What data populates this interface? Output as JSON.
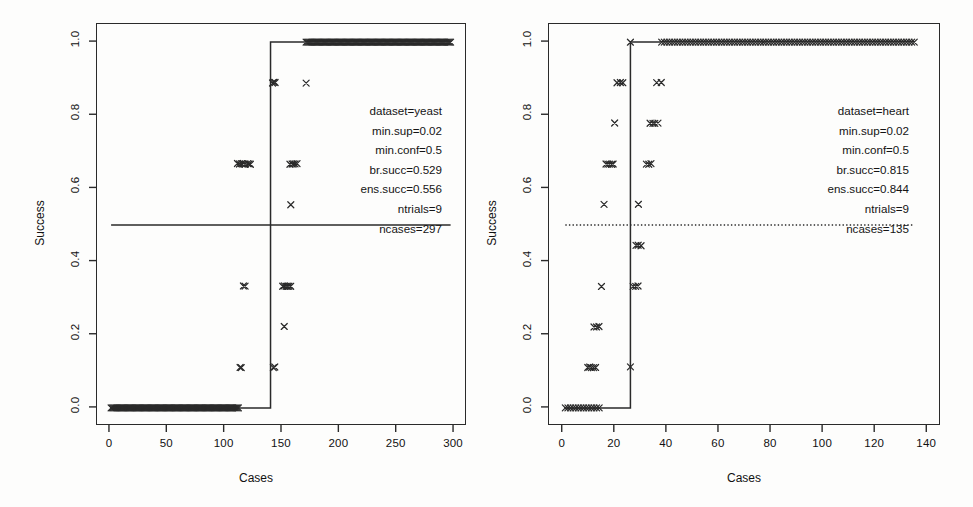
{
  "figure": {
    "panel_count": 2,
    "background_color": "#fdfdfc",
    "ink_color": "#2a2a2a"
  },
  "chart_data": [
    {
      "type": "scatter",
      "title": "",
      "xlabel": "Cases",
      "ylabel": "Success",
      "xlim": [
        0,
        300
      ],
      "ylim": [
        0.0,
        1.0
      ],
      "xticks": [
        0,
        50,
        100,
        150,
        200,
        250,
        300
      ],
      "yticks": [
        "0.0",
        "0.2",
        "0.4",
        "0.6",
        "0.8",
        "1.0"
      ],
      "grid": false,
      "legend": "none",
      "marker": "x",
      "annotations": {
        "dataset": "dataset=yeast",
        "min_sup": "min.sup=0.02",
        "min_conf": "min.conf=0.5",
        "br_succ": "br.succ=0.529",
        "ens_succ": "ens.succ=0.556",
        "ntrials": "ntrials=9",
        "ncases": "ncases=297"
      },
      "reference_line": {
        "y": 0.5,
        "style": "solid",
        "x_from": 1,
        "x_to": 297
      },
      "step_line": {
        "style": "solid",
        "points": [
          [
            1,
            0.0
          ],
          [
            140,
            0.0
          ],
          [
            140,
            1.0
          ],
          [
            297,
            1.0
          ]
        ]
      },
      "series": [
        {
          "name": "per-case success",
          "dense_runs": [
            {
              "y": 0.0,
              "x_from": 1,
              "x_to": 112,
              "count": 112
            },
            {
              "y": 1.0,
              "x_from": 171,
              "x_to": 297,
              "count": 127
            }
          ],
          "clusters": [
            {
              "x": 117,
              "y": 0.667,
              "count": 9,
              "spread": 11
            },
            {
              "x": 160,
              "y": 0.667,
              "count": 5,
              "spread": 6
            },
            {
              "x": 143,
              "y": 0.889,
              "count": 3,
              "spread": 2
            },
            {
              "x": 171,
              "y": 0.889,
              "count": 1,
              "spread": 0
            },
            {
              "x": 158,
              "y": 0.556,
              "count": 1,
              "spread": 0
            },
            {
              "x": 117,
              "y": 0.333,
              "count": 2,
              "spread": 1
            },
            {
              "x": 154,
              "y": 0.333,
              "count": 6,
              "spread": 7
            },
            {
              "x": 152,
              "y": 0.222,
              "count": 1,
              "spread": 0
            },
            {
              "x": 114,
              "y": 0.111,
              "count": 2,
              "spread": 1
            },
            {
              "x": 143,
              "y": 0.111,
              "count": 2,
              "spread": 1
            }
          ]
        }
      ]
    },
    {
      "type": "scatter",
      "title": "",
      "xlabel": "Cases",
      "ylabel": "Success",
      "xlim": [
        0,
        140
      ],
      "ylim": [
        0.0,
        1.0
      ],
      "xticks": [
        0,
        20,
        40,
        60,
        80,
        100,
        120,
        140
      ],
      "yticks": [
        "0.0",
        "0.2",
        "0.4",
        "0.6",
        "0.8",
        "1.0"
      ],
      "grid": false,
      "legend": "none",
      "marker": "x",
      "annotations": {
        "dataset": "dataset=heart",
        "min_sup": "min.sup=0.02",
        "min_conf": "min.conf=0.5",
        "br_succ": "br.succ=0.815",
        "ens_succ": "ens.succ=0.844",
        "ntrials": "ntrials=9",
        "ncases": "ncases=135"
      },
      "reference_line": {
        "y": 0.5,
        "style": "dotted",
        "x_from": 1,
        "x_to": 135
      },
      "step_line": {
        "style": "solid",
        "points": [
          [
            1,
            0.0
          ],
          [
            26,
            0.0
          ],
          [
            26,
            1.0
          ],
          [
            135,
            1.0
          ]
        ]
      },
      "series": [
        {
          "name": "per-case success",
          "dense_runs": [
            {
              "y": 0.0,
              "x_from": 1,
              "x_to": 14,
              "count": 14
            },
            {
              "y": 1.0,
              "x_from": 38,
              "x_to": 135,
              "count": 98
            }
          ],
          "clusters": [
            {
              "x": 26,
              "y": 1.0,
              "count": 1,
              "spread": 0
            },
            {
              "x": 22,
              "y": 0.889,
              "count": 3,
              "spread": 2
            },
            {
              "x": 37,
              "y": 0.889,
              "count": 2,
              "spread": 2
            },
            {
              "x": 20,
              "y": 0.778,
              "count": 1,
              "spread": 0
            },
            {
              "x": 35,
              "y": 0.778,
              "count": 4,
              "spread": 3
            },
            {
              "x": 18,
              "y": 0.667,
              "count": 5,
              "spread": 3
            },
            {
              "x": 33,
              "y": 0.667,
              "count": 3,
              "spread": 2
            },
            {
              "x": 16,
              "y": 0.556,
              "count": 1,
              "spread": 0
            },
            {
              "x": 29,
              "y": 0.556,
              "count": 1,
              "spread": 0
            },
            {
              "x": 29,
              "y": 0.444,
              "count": 3,
              "spread": 2
            },
            {
              "x": 15,
              "y": 0.333,
              "count": 1,
              "spread": 0
            },
            {
              "x": 28,
              "y": 0.333,
              "count": 3,
              "spread": 2
            },
            {
              "x": 13,
              "y": 0.222,
              "count": 3,
              "spread": 2
            },
            {
              "x": 11,
              "y": 0.111,
              "count": 5,
              "spread": 3
            },
            {
              "x": 26,
              "y": 0.111,
              "count": 1,
              "spread": 0
            }
          ]
        }
      ]
    }
  ]
}
